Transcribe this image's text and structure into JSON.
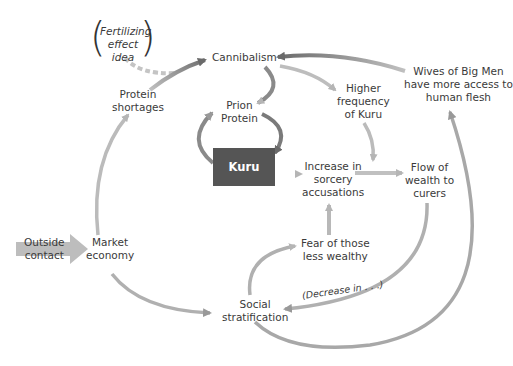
{
  "colors": {
    "arrow_light": "#b8b8b8",
    "arrow_dark": "#6e6e6e",
    "kuru_box": "#555555",
    "text": "#3a3a3a"
  },
  "nodes": {
    "fertilizing": [
      "Fertilizing",
      "effect",
      "idea"
    ],
    "cannibalism": "Cannibalism",
    "protein_shortages": [
      "Protein",
      "shortages"
    ],
    "prion_protein": [
      "Prion",
      "Protein"
    ],
    "higher_frequency": [
      "Higher",
      "frequency",
      "of Kuru"
    ],
    "wives": [
      "Wives of Big Men",
      "have more access to",
      "human  flesh"
    ],
    "kuru": "Kuru",
    "sorcery": [
      "Increase in",
      "sorcery",
      "accusations"
    ],
    "flow_wealth": [
      "Flow of",
      "wealth to",
      "curers"
    ],
    "fear": [
      "Fear of those",
      "less wealthy"
    ],
    "outside_contact": [
      "Outside",
      "contact"
    ],
    "market_economy": [
      "Market",
      "economy"
    ],
    "social_stratification": [
      "Social",
      "stratification"
    ],
    "decrease_label": "(Decrease in . . .)"
  },
  "edges": [
    {
      "from": "Fertilizing effect idea",
      "to": "Cannibalism",
      "style": "dashed"
    },
    {
      "from": "Protein shortages",
      "to": "Cannibalism"
    },
    {
      "from": "Market economy",
      "to": "Protein shortages"
    },
    {
      "from": "Outside contact",
      "to": "Market economy",
      "style": "block"
    },
    {
      "from": "Market economy",
      "to": "Social stratification"
    },
    {
      "from": "Cannibalism",
      "to": "Prion Protein"
    },
    {
      "from": "Prion Protein",
      "to": "Kuru"
    },
    {
      "from": "Kuru",
      "to": "Prion Protein"
    },
    {
      "from": "Cannibalism",
      "to": "Higher frequency of Kuru"
    },
    {
      "from": "Higher frequency of Kuru",
      "to": "Flow of wealth to curers"
    },
    {
      "from": "Kuru",
      "to": "Increase in sorcery accusations"
    },
    {
      "from": "Increase in sorcery accusations",
      "to": "Flow of wealth to curers"
    },
    {
      "from": "Fear of those less wealthy",
      "to": "Increase in sorcery accusations"
    },
    {
      "from": "Social stratification",
      "to": "Fear of those less wealthy"
    },
    {
      "from": "Flow of wealth to curers",
      "to": "Social stratification",
      "label": "(Decrease in . . .)"
    },
    {
      "from": "Social stratification",
      "to": "Wives of Big Men have more access to human flesh"
    },
    {
      "from": "Wives of Big Men have more access to human flesh",
      "to": "Cannibalism"
    }
  ]
}
